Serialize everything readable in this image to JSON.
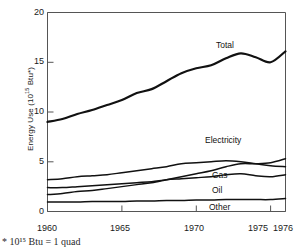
{
  "chart_data": {
    "type": "line",
    "title": "",
    "xlabel": "",
    "ylabel": "Energy Use (10",
    "ylabel_exp": "15",
    "ylabel_tail": " Btu*)",
    "xlim": [
      1960,
      1976
    ],
    "ylim": [
      0,
      20
    ],
    "grid": false,
    "legend_position": "inline-right",
    "xticks": [
      1960,
      1965,
      1970,
      1975,
      1976
    ],
    "xtick_labels": [
      "1960",
      "1965",
      "1970",
      "1975",
      "1976"
    ],
    "yticks": [
      0,
      5,
      10,
      15,
      20
    ],
    "ytick_labels": [
      "0",
      "5",
      "10",
      "15",
      "20"
    ],
    "x": [
      1960,
      1961,
      1962,
      1963,
      1964,
      1965,
      1966,
      1967,
      1968,
      1969,
      1970,
      1971,
      1972,
      1973,
      1974,
      1975,
      1976
    ],
    "series": [
      {
        "name": "Total",
        "label": "Total",
        "values": [
          9.0,
          9.3,
          9.8,
          10.2,
          10.7,
          11.2,
          11.9,
          12.3,
          13.1,
          13.9,
          14.4,
          14.7,
          15.4,
          15.9,
          15.5,
          15.0,
          16.1
        ]
      },
      {
        "name": "Electricity",
        "label": "Electricity",
        "values": [
          1.7,
          1.8,
          2.0,
          2.1,
          2.3,
          2.5,
          2.7,
          2.9,
          3.2,
          3.5,
          3.8,
          4.1,
          4.5,
          4.8,
          4.8,
          4.9,
          5.3
        ]
      },
      {
        "name": "Gas",
        "label": "Gas",
        "values": [
          3.2,
          3.3,
          3.5,
          3.6,
          3.7,
          3.9,
          4.1,
          4.3,
          4.5,
          4.8,
          4.9,
          5.0,
          5.1,
          5.0,
          4.8,
          4.6,
          4.5
        ]
      },
      {
        "name": "Oil",
        "label": "Oil",
        "values": [
          2.4,
          2.4,
          2.5,
          2.6,
          2.7,
          2.8,
          2.9,
          3.0,
          3.2,
          3.3,
          3.4,
          3.5,
          3.7,
          3.8,
          3.6,
          3.5,
          3.7
        ]
      },
      {
        "name": "Other",
        "label": "Other",
        "values": [
          0.95,
          0.95,
          0.95,
          1.0,
          1.0,
          1.0,
          1.05,
          1.05,
          1.1,
          1.1,
          1.15,
          1.15,
          1.2,
          1.2,
          1.2,
          1.2,
          1.3
        ]
      }
    ],
    "footnote": "* 10¹⁵ Btu = 1 quad",
    "line_color": "#111111"
  }
}
